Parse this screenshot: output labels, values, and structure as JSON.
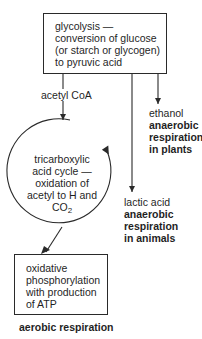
{
  "diagram": {
    "glycolysis_box": {
      "lines": [
        "glycolysis —",
        "conversion of glucose",
        "(or starch or glycogen)",
        "to pyruvic acid"
      ]
    },
    "acetyl_coa_label": "acetyl CoA",
    "ethanol_branch": {
      "product": "ethanol",
      "type_lines": [
        "anaerobic",
        "respiration",
        "in plants"
      ]
    },
    "lactic_branch": {
      "product": "lactic acid",
      "type_lines": [
        "anaerobic",
        "respiration",
        "in animals"
      ]
    },
    "tca_cycle": {
      "lines": [
        "tricarboxylic",
        "acid cycle —",
        "oxidation of",
        "acetyl to H and"
      ],
      "co2_main": "CO",
      "co2_sub": "2"
    },
    "oxphos_box": {
      "lines": [
        "oxidative",
        "phosphorylation",
        "with production",
        "of ATP"
      ]
    },
    "aerobic_label": "aerobic respiration",
    "colors": {
      "stroke": "#2a2a2a",
      "text": "#1f1f1f",
      "background": "#ffffff"
    }
  }
}
